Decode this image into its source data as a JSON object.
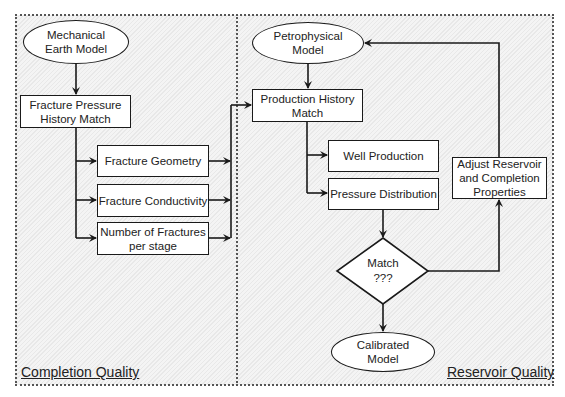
{
  "diagram": {
    "panels": [
      {
        "id": "completion",
        "label": "Completion Quality"
      },
      {
        "id": "reservoir",
        "label": "Reservoir Quality"
      }
    ],
    "nodes": {
      "mechanical_earth_model": {
        "shape": "ellipse",
        "line1": "Mechanical",
        "line2": "Earth Model"
      },
      "fracture_pressure_history_match": {
        "shape": "rectangle",
        "line1": "Fracture Pressure",
        "line2": "History Match"
      },
      "fracture_geometry": {
        "shape": "rectangle",
        "line1": "Fracture Geometry"
      },
      "fracture_conductivity": {
        "shape": "rectangle",
        "line1": "Fracture Conductivity"
      },
      "number_of_fractures": {
        "shape": "rectangle",
        "line1": "Number of Fractures",
        "line2": "per stage"
      },
      "petrophysical_model": {
        "shape": "ellipse",
        "line1": "Petrophysical",
        "line2": "Model"
      },
      "production_history_match": {
        "shape": "rectangle",
        "line1": "Production History",
        "line2": "Match"
      },
      "well_production": {
        "shape": "rectangle",
        "line1": "Well Production"
      },
      "pressure_distribution": {
        "shape": "rectangle",
        "line1": "Pressure Distribution"
      },
      "match_decision": {
        "shape": "diamond",
        "line1": "Match",
        "line2": "???"
      },
      "adjust_properties": {
        "shape": "rectangle",
        "line1": "Adjust Reservoir",
        "line2": "and Completion",
        "line3": "Properties"
      },
      "calibrated_model": {
        "shape": "ellipse",
        "line1": "Calibrated",
        "line2": "Model"
      }
    },
    "edges": [
      [
        "mechanical_earth_model",
        "fracture_pressure_history_match"
      ],
      [
        "fracture_pressure_history_match",
        "fracture_geometry"
      ],
      [
        "fracture_pressure_history_match",
        "fracture_conductivity"
      ],
      [
        "fracture_pressure_history_match",
        "number_of_fractures"
      ],
      [
        "fracture_geometry",
        "production_history_match"
      ],
      [
        "fracture_conductivity",
        "production_history_match"
      ],
      [
        "number_of_fractures",
        "production_history_match"
      ],
      [
        "petrophysical_model",
        "production_history_match"
      ],
      [
        "production_history_match",
        "well_production"
      ],
      [
        "production_history_match",
        "pressure_distribution"
      ],
      [
        "pressure_distribution",
        "match_decision"
      ],
      [
        "match_decision",
        "calibrated_model"
      ],
      [
        "match_decision",
        "adjust_properties"
      ],
      [
        "adjust_properties",
        "petrophysical_model"
      ]
    ],
    "colors": {
      "line": "#1a1a1a",
      "node_fill": "#ffffff",
      "panel_fill": "#f4f4f4",
      "border": "#555555"
    }
  }
}
